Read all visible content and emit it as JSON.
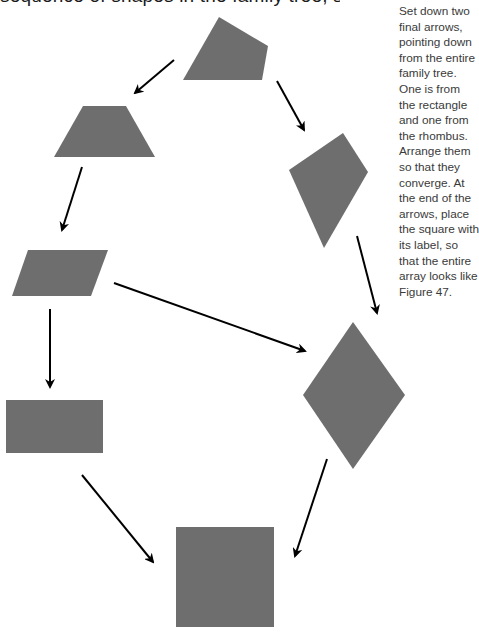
{
  "header": {
    "cut_text": "sequence of shapes in the family tree, step by step"
  },
  "instruction": {
    "text": "Set down two\nfinal arrows,\npointing down\nfrom the entire\nfamily tree.\nOne is from\nthe rectangle\nand one from\nthe rhombus.\nArrange them\nso that they\nconverge. At\nthe end of the\narrows, place\nthe square with\nits label, so\nthat the entire\narray looks like\nFigure 47."
  },
  "colors": {
    "shape_fill": "#6e6e6e",
    "arrow": "#000000",
    "text": "#3a3a3a",
    "background": "#ffffff"
  },
  "shapes": [
    {
      "name": "irregular-quadrilateral",
      "points": "219,17 268,46 262,80 183,80"
    },
    {
      "name": "trapezoid",
      "points": "83,106 126,106 155,157 54,157"
    },
    {
      "name": "kite",
      "points": "343,133 368,172 324,248 289,170"
    },
    {
      "name": "parallelogram",
      "points": "28,250 108,250 91,296 12,296"
    },
    {
      "name": "rhombus",
      "points": "353,322 405,395 353,469 303,395"
    },
    {
      "name": "rectangle",
      "points": "6,400 103,400 103,453 6,453"
    },
    {
      "name": "square",
      "points": "176,527 274,527 274,627 176,627"
    }
  ],
  "arrows": [
    {
      "from": "irregular-quadrilateral",
      "to": "trapezoid",
      "x1": 174,
      "y1": 60,
      "x2": 135,
      "y2": 93
    },
    {
      "from": "irregular-quadrilateral",
      "to": "kite",
      "x1": 277,
      "y1": 81,
      "x2": 304,
      "y2": 130
    },
    {
      "from": "trapezoid",
      "to": "parallelogram",
      "x1": 82,
      "y1": 167,
      "x2": 62,
      "y2": 230
    },
    {
      "from": "parallelogram",
      "to": "rectangle",
      "x1": 50,
      "y1": 309,
      "x2": 50,
      "y2": 387
    },
    {
      "from": "parallelogram",
      "to": "rhombus",
      "x1": 114,
      "y1": 283,
      "x2": 305,
      "y2": 351
    },
    {
      "from": "kite",
      "to": "rhombus",
      "x1": 357,
      "y1": 236,
      "x2": 377,
      "y2": 313
    },
    {
      "from": "rectangle",
      "to": "square",
      "x1": 82,
      "y1": 475,
      "x2": 153,
      "y2": 562
    },
    {
      "from": "rhombus",
      "to": "square",
      "x1": 327,
      "y1": 459,
      "x2": 295,
      "y2": 556
    }
  ]
}
